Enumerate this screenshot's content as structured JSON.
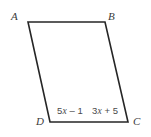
{
  "figure": {
    "kind": "geometry-diagram",
    "shape": "parallelogram",
    "background_color": "#ffffff",
    "stroke_color": "#262626",
    "stroke_width": 1.6,
    "label_color": "#3b3b3b",
    "expression_color": "#4a4a4a",
    "vertices": [
      {
        "name": "A",
        "label": "A",
        "x": 28,
        "y": 22,
        "label_x": 11,
        "label_y": 11
      },
      {
        "name": "B",
        "label": "B",
        "x": 105,
        "y": 22,
        "label_x": 108,
        "label_y": 11
      },
      {
        "name": "C",
        "label": "C",
        "x": 128,
        "y": 122,
        "label_x": 133,
        "label_y": 116
      },
      {
        "name": "D",
        "label": "D",
        "x": 50,
        "y": 122,
        "label_x": 36,
        "label_y": 116
      }
    ],
    "edges": [
      {
        "name": "AB",
        "from": "A",
        "to": "B"
      },
      {
        "name": "BC",
        "from": "B",
        "to": "C"
      },
      {
        "name": "CD",
        "from": "C",
        "to": "D"
      },
      {
        "name": "DA",
        "from": "D",
        "to": "A"
      }
    ],
    "measure_labels": [
      {
        "name": "dc-left",
        "text": "5x – 1",
        "on_edge": "DC",
        "x": 57,
        "y": 106
      },
      {
        "name": "dc-right",
        "text": "3x + 5",
        "on_edge": "DC",
        "x": 92,
        "y": 106
      }
    ],
    "polygon_points": "28,22 105,22 128,122 50,122"
  }
}
